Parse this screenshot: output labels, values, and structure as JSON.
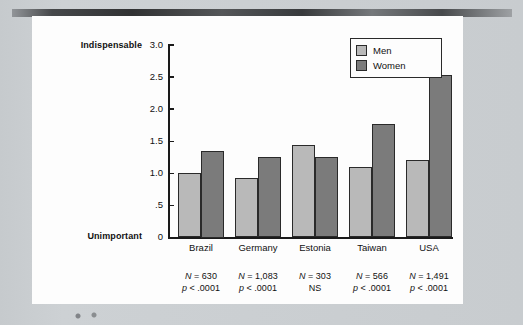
{
  "figure": {
    "background_color": "#fdfdfd",
    "surround_color": "#c9cdd0"
  },
  "chart_data": {
    "type": "bar",
    "title": "",
    "xlabel": "",
    "ylabel": "",
    "ylim": [
      0,
      3.0
    ],
    "grid": false,
    "legend_position": "top-right",
    "y_axis_low_label": "Unimportant",
    "y_axis_high_label": "Indispensable",
    "tick_labels": [
      "0",
      ".5",
      "1.0",
      "1.5",
      "2.0",
      "2.5",
      "3.0"
    ],
    "tick_values": [
      0,
      0.5,
      1.0,
      1.5,
      2.0,
      2.5,
      3.0
    ],
    "categories": [
      "Brazil",
      "Germany",
      "Estonia",
      "Taiwan",
      "USA"
    ],
    "series": [
      {
        "name": "Men",
        "color": "#b9b9b9",
        "values": [
          1.0,
          0.93,
          1.44,
          1.1,
          1.21
        ]
      },
      {
        "name": "Women",
        "color": "#7b7b7b",
        "values": [
          1.35,
          1.25,
          1.26,
          1.77,
          2.53
        ]
      }
    ],
    "annotations": [
      {
        "category": "Brazil",
        "n": "N = 630",
        "p": "p < .0001"
      },
      {
        "category": "Germany",
        "n": "N = 1,083",
        "p": "p < .0001"
      },
      {
        "category": "Estonia",
        "n": "N = 303",
        "p": "NS"
      },
      {
        "category": "Taiwan",
        "n": "N = 566",
        "p": "p < .0001"
      },
      {
        "category": "USA",
        "n": "N = 1,491",
        "p": "p < .0001"
      }
    ]
  },
  "legend": {
    "items": [
      {
        "label": "Men",
        "color": "#b9b9b9"
      },
      {
        "label": "Women",
        "color": "#7b7b7b"
      }
    ]
  }
}
